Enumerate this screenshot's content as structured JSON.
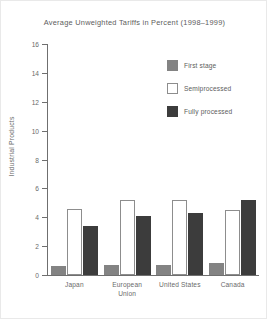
{
  "chart_data": {
    "type": "bar",
    "title": "Average Unweighted Tariffs in Percent (1998–1999)",
    "xlabel": "",
    "ylabel": "Industrial Products",
    "ylim": [
      0,
      16
    ],
    "ytick_labels": [
      "16",
      "14",
      "12",
      "10",
      "8",
      "6",
      "4",
      "2",
      "0"
    ],
    "ytick_values": [
      16,
      14,
      12,
      10,
      8,
      6,
      4,
      2,
      0
    ],
    "grid": false,
    "legend_position": "upper right",
    "categories": [
      "Japan",
      "European Union",
      "United States",
      "Canada"
    ],
    "category_lines": [
      [
        "Japan"
      ],
      [
        "European",
        "Union"
      ],
      [
        "United States"
      ],
      [
        "Canada"
      ]
    ],
    "series": [
      {
        "name": "First stage",
        "color": "#838383",
        "values": [
          0.6,
          0.7,
          0.7,
          0.8
        ]
      },
      {
        "name": "Semiprocessed",
        "color": "#ffffff",
        "values": [
          4.6,
          5.2,
          5.2,
          4.5
        ]
      },
      {
        "name": "Fully processed",
        "color": "#3c3c3c",
        "values": [
          3.4,
          4.1,
          4.3,
          5.2
        ]
      }
    ]
  },
  "legend": {
    "items": [
      {
        "label": "First stage",
        "swatch": "first-stage"
      },
      {
        "label": "Semiprocessed",
        "swatch": "semiprocessed"
      },
      {
        "label": "Fully processed",
        "swatch": "fully"
      }
    ]
  },
  "colors": {
    "first_stage": "#838383",
    "semiprocessed": "#ffffff",
    "fully_processed": "#3c3c3c",
    "axis": "#6f6f6f",
    "text": "#6a6a6a",
    "background": "#ffffff"
  }
}
